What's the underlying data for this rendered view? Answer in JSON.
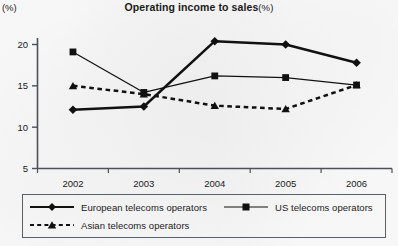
{
  "chart_data": {
    "type": "line",
    "title_main": "Operating income to sales",
    "title_suffix": "(%)",
    "xlabel": "",
    "ylabel": "(%)",
    "y_unit_label": "(%)",
    "categories": [
      "2002",
      "2003",
      "2004",
      "2005",
      "2006"
    ],
    "x": [
      2002,
      2003,
      2004,
      2005,
      2006
    ],
    "ylim": [
      3.5,
      21.5
    ],
    "yticks": [
      5,
      10,
      15,
      20
    ],
    "ytick_labels": [
      "5",
      "10",
      "15",
      "20"
    ],
    "grid": false,
    "legend_position": "below-outside",
    "series": [
      {
        "name": "European telecoms operators",
        "marker": "diamond",
        "linestyle": "solid",
        "linewidth": "thick",
        "color": "#111111",
        "values": [
          12.1,
          12.5,
          20.4,
          20.0,
          17.8
        ]
      },
      {
        "name": "US telecoms operators",
        "marker": "square",
        "linestyle": "solid",
        "linewidth": "thin",
        "color": "#111111",
        "values": [
          19.1,
          14.2,
          16.2,
          16.0,
          15.1
        ]
      },
      {
        "name": "Asian telecoms operators",
        "marker": "triangle",
        "linestyle": "dashed",
        "linewidth": "thick",
        "color": "#111111",
        "values": [
          15.0,
          14.0,
          12.6,
          12.2,
          15.1
        ]
      }
    ]
  },
  "legend": {
    "entries": [
      {
        "label": "European telecoms operators",
        "marker": "diamond",
        "linestyle": "solid"
      },
      {
        "label": "US telecoms operators",
        "marker": "square",
        "linestyle": "solid"
      },
      {
        "label": "Asian telecoms operators",
        "marker": "triangle",
        "linestyle": "dashed"
      }
    ]
  },
  "colors": {
    "ink": "#111111",
    "axis": "#4c5058",
    "legend_border": "#5b5f66",
    "background": "#fbfbfb"
  }
}
